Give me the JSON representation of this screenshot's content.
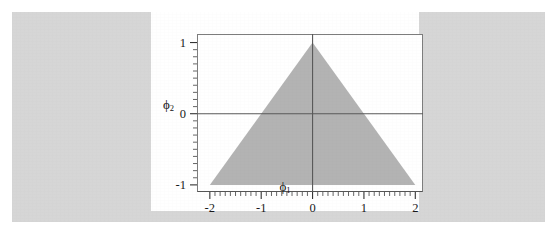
{
  "figure": {
    "background_color": "#d6d6d6",
    "card_color": "#ffffff",
    "frame_color": "#7d7d7d"
  },
  "chart_data": {
    "type": "area",
    "title": "",
    "subtitle": "",
    "xlabel": "ϕ₁",
    "xlabel_base": "ϕ",
    "xlabel_sub": "1",
    "ylabel": "ϕ₂",
    "ylabel_base": "ϕ",
    "ylabel_sub": "2",
    "xlim": [
      -2.25,
      2.15
    ],
    "ylim": [
      -1.1,
      1.12
    ],
    "xticks": [
      -2,
      -1,
      0,
      1,
      2
    ],
    "xticklabels": [
      "-2",
      "-1",
      "0",
      "1",
      "2"
    ],
    "yticks": [
      -1,
      0,
      1
    ],
    "yticklabels": [
      "-1",
      "0",
      "1"
    ],
    "x_minor_tick_step": 0.1,
    "y_minor_tick_step": 0.1,
    "grid": false,
    "legend": null,
    "legend_position": "none",
    "zero_lines": {
      "x_zero_line": true,
      "y_zero_line": true,
      "color": "#5a5a5a"
    },
    "region": {
      "name": "stationarity-triangle",
      "fill_color": "#b3b3b3",
      "vertices": [
        {
          "x": -2,
          "y": -1
        },
        {
          "x": 0,
          "y": 1
        },
        {
          "x": 2,
          "y": -1
        }
      ],
      "boundaries": [
        "ϕ₂ = ϕ₁ + 1",
        "ϕ₂ = 1 - ϕ₁",
        "ϕ₂ = -1"
      ]
    }
  }
}
